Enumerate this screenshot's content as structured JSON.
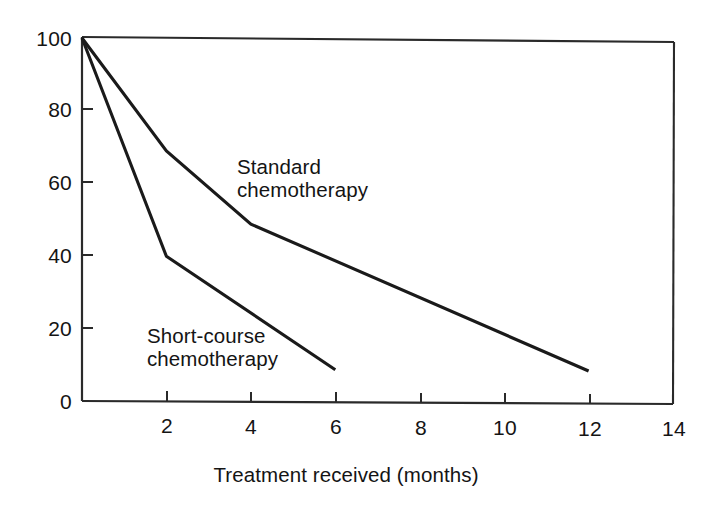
{
  "chart_data": {
    "type": "line",
    "title": "",
    "subtitle": "",
    "xlabel": "Treatment received (months)",
    "ylabel": "",
    "xlim": [
      0,
      14
    ],
    "ylim": [
      0,
      100
    ],
    "xticks": [
      0,
      2,
      4,
      6,
      8,
      10,
      12,
      14
    ],
    "xtick_labels": [
      "",
      "2",
      "4",
      "6",
      "8",
      "10",
      "12",
      "14"
    ],
    "yticks": [
      0,
      20,
      40,
      60,
      80,
      100
    ],
    "ytick_labels": [
      "0",
      "20",
      "40",
      "60",
      "80",
      "100"
    ],
    "grid": false,
    "legend": "inline-annotations",
    "series": [
      {
        "name": "Standard chemotherapy",
        "label_line1": "Standard",
        "label_line2": "chemotherapy",
        "color": "#1a1a1a",
        "x": [
          0,
          2,
          4,
          12
        ],
        "y": [
          100,
          69,
          49,
          9
        ]
      },
      {
        "name": "Short-course chemotherapy",
        "label_line1": "Short-course",
        "label_line2": "chemotherapy",
        "color": "#1a1a1a",
        "x": [
          0,
          2,
          6
        ],
        "y": [
          100,
          40,
          9
        ]
      }
    ]
  },
  "figure": {
    "background_color": "#ffffff",
    "axis_color": "#1a1a1a",
    "text_color": "#141414"
  }
}
